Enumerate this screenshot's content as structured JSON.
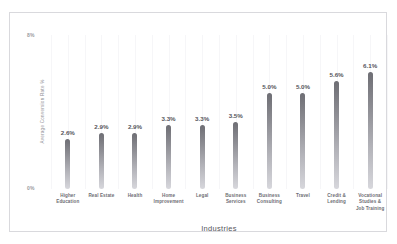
{
  "chart_data": {
    "type": "bar",
    "title": "",
    "xlabel": "Industries",
    "ylabel": "Average Conversion Rate %",
    "ylim": [
      0,
      8
    ],
    "grid": true,
    "legend": "none",
    "y_ticks": [
      "0%",
      "8%"
    ],
    "categories": [
      "Higher Education",
      "Real Estate",
      "Health",
      "Home Improvement",
      "Legal",
      "Business Services",
      "Business Consulting",
      "Travel",
      "Credit & Lending",
      "Vocational Studies & Job Training"
    ],
    "values": [
      2.6,
      2.9,
      2.9,
      3.3,
      3.3,
      3.5,
      5.0,
      5.0,
      5.6,
      6.1
    ],
    "value_labels": [
      "2.6%",
      "2.9%",
      "2.9%",
      "3.3%",
      "3.3%",
      "3.5%",
      "5.0%",
      "5.0%",
      "5.6%",
      "6.1%"
    ],
    "colors": {
      "bar_top": "#6e6e74",
      "bar_bottom": "#d7d7dc",
      "label_text": "#55555b",
      "axis_text": "#9a9aa0",
      "frame_border": "#d9d9dd",
      "gridline": "#f6f6f8",
      "background": "#ffffff"
    }
  },
  "axis": {
    "tick_top": "8%",
    "tick_bottom": "0%",
    "y_title": "Average Conversion Rate %",
    "x_title": "Industries"
  },
  "title_sliver": ""
}
